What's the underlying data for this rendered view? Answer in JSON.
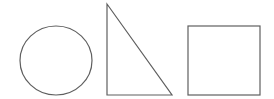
{
  "canvas": {
    "width": 274,
    "height": 99,
    "background": "#ffffff"
  },
  "style": {
    "stroke": "#5f5f5f",
    "fill": "none"
  },
  "shapes": [
    {
      "kind": "circle",
      "label": "circle",
      "cx": 56,
      "cy": 60.5,
      "rx": 36,
      "ry": 34.5
    },
    {
      "kind": "triangle",
      "label": "right triangle",
      "points": "107,4 107,95 172,95"
    },
    {
      "kind": "square",
      "label": "square",
      "x": 188,
      "y": 26,
      "width": 72,
      "height": 69
    }
  ]
}
